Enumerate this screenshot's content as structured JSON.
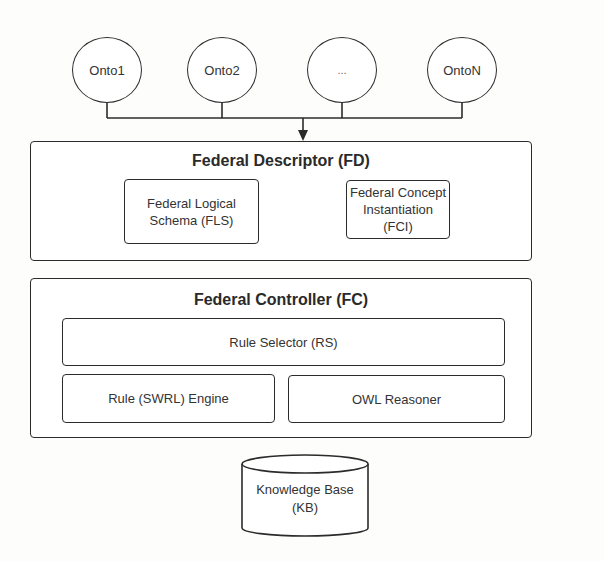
{
  "diagram": {
    "ontologies": [
      {
        "label": "Onto1"
      },
      {
        "label": "Onto2"
      },
      {
        "label": "..."
      },
      {
        "label": "OntoN"
      }
    ],
    "federal_descriptor": {
      "title": "Federal Descriptor (FD)",
      "components": [
        {
          "line1": "Federal Logical",
          "line2": "Schema (FLS)"
        },
        {
          "line1": "Federal Concept",
          "line2": "Instantiation (FCI)"
        }
      ]
    },
    "federal_controller": {
      "title": "Federal Controller (FC)",
      "rule_selector": "Rule Selector (RS)",
      "rule_engine": "Rule (SWRL) Engine",
      "owl_reasoner": "OWL Reasoner"
    },
    "knowledge_base": {
      "line1": "Knowledge Base",
      "line2": "(KB)"
    },
    "colors": {
      "stroke": "#2b2b2b",
      "background": "#fdfdfb",
      "text": "#333333"
    }
  }
}
